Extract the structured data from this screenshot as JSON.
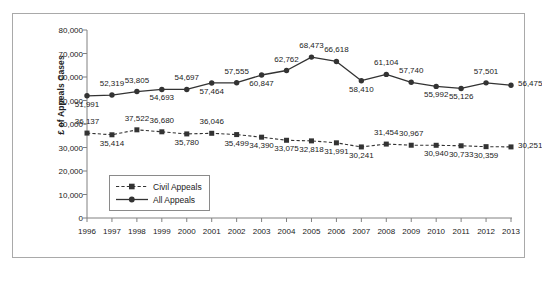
{
  "chart_data": {
    "type": "line",
    "title": "",
    "xlabel": "",
    "ylabel": "£ of Appeals Cases",
    "ylim": [
      0,
      80000
    ],
    "yticks": [
      "0",
      "10,000",
      "20,000",
      "30,000",
      "40,000",
      "50,000",
      "60,000",
      "70,000",
      "80,000"
    ],
    "ytick_values": [
      0,
      10000,
      20000,
      30000,
      40000,
      50000,
      60000,
      70000,
      80000
    ],
    "grid": false,
    "legend_position": "inside-lower-left",
    "categories": [
      "1996",
      "1997",
      "1998",
      "1999",
      "2000",
      "2001",
      "2002",
      "2003",
      "2004",
      "2005",
      "2006",
      "2007",
      "2008",
      "2009",
      "2010",
      "2011",
      "2012",
      "2013"
    ],
    "series": [
      {
        "name": "Civil Appeals",
        "style": "dashed",
        "marker": "square",
        "color": "#333333",
        "values": [
          36137,
          35414,
          37522,
          36680,
          35780,
          36046,
          35499,
          34390,
          33075,
          32818,
          31991,
          30241,
          31454,
          30967,
          30940,
          30733,
          30359,
          30251
        ],
        "labels": [
          "36,137",
          "35,414",
          "37,522",
          "36,680",
          "35,780",
          "36,046",
          "35,499",
          "34,390",
          "33,075",
          "32,818",
          "31,991",
          "30,241",
          "31,454",
          "30,967",
          "30,940",
          "30,733",
          "30,359",
          "30,251"
        ],
        "label_positions": [
          "above",
          "below",
          "above",
          "above",
          "below",
          "above",
          "below",
          "below",
          "below",
          "below",
          "below",
          "below",
          "above",
          "above",
          "below",
          "below",
          "below",
          "right"
        ]
      },
      {
        "name": "All Appeals",
        "style": "solid",
        "marker": "circle",
        "color": "#333333",
        "values": [
          51991,
          52319,
          53805,
          54693,
          54697,
          57464,
          57555,
          60847,
          62762,
          68473,
          66618,
          58410,
          61104,
          57740,
          55992,
          55126,
          57501,
          56475
        ],
        "labels": [
          "51,991",
          "52,319",
          "53,805",
          "54,693",
          "54,697",
          "57,464",
          "57,555",
          "60,847",
          "62,762",
          "68,473",
          "66,618",
          "58,410",
          "61,104",
          "57,740",
          "55,992",
          "55,126",
          "57,501",
          "56,475"
        ],
        "label_positions": [
          "below",
          "above",
          "above",
          "below",
          "above",
          "below",
          "above",
          "below",
          "above",
          "above",
          "above",
          "below",
          "above",
          "above",
          "below",
          "below",
          "above",
          "right"
        ]
      }
    ]
  },
  "legend": {
    "items": [
      {
        "label": "Civil Appeals"
      },
      {
        "label": "All Appeals"
      }
    ]
  }
}
